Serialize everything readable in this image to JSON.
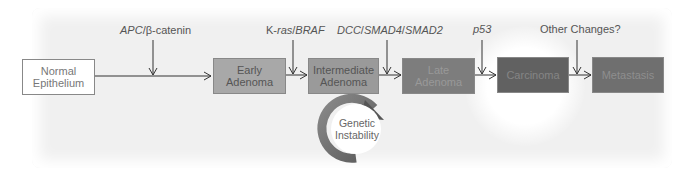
{
  "diagram": {
    "type": "flow",
    "title": "",
    "stages": [
      {
        "id": "normal",
        "label_line1": "Normal",
        "label_line2": "Epithelium",
        "fill": "#ffffff"
      },
      {
        "id": "early",
        "label_line1": "Early",
        "label_line2": "Adenoma",
        "fill": "#a8a8a8"
      },
      {
        "id": "intermediate",
        "label_line1": "Intermediate",
        "label_line2": "Adenoma",
        "fill": "#9a9a9a"
      },
      {
        "id": "late",
        "label_line1": "Late",
        "label_line2": "Adenoma",
        "fill": "#7d7d7d"
      },
      {
        "id": "carcinoma",
        "label_line1": "Carcinoma",
        "label_line2": "",
        "fill": "#616161"
      },
      {
        "id": "metastasis",
        "label_line1": "Metastasis",
        "label_line2": "",
        "fill": "#6f6f6f"
      }
    ],
    "mutations": [
      {
        "italic": "APC",
        "sep": "/",
        "rest": "β-catenin",
        "between": [
          "normal",
          "early"
        ]
      },
      {
        "plain": "K-",
        "italic": "ras",
        "sep": "/",
        "italic2": "BRAF",
        "between": [
          "early",
          "intermediate"
        ]
      },
      {
        "italic": "DCC",
        "sep": "/",
        "italic2": "SMAD4",
        "sep2": "/",
        "italic3": "SMAD2",
        "between": [
          "intermediate",
          "late"
        ]
      },
      {
        "italic": "p53",
        "between": [
          "late",
          "carcinoma"
        ]
      },
      {
        "plain": "Other Changes?",
        "between": [
          "carcinoma",
          "metastasis"
        ]
      }
    ],
    "cycle": {
      "label_line1": "Genetic",
      "label_line2": "Instability",
      "attached_to": "intermediate"
    }
  }
}
